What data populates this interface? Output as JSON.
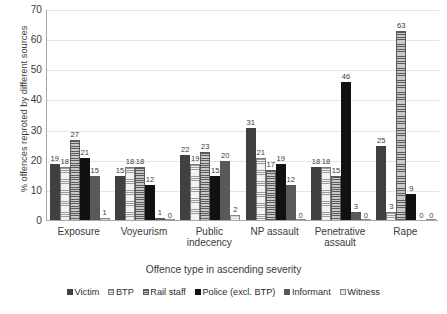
{
  "chart_data": {
    "type": "bar",
    "title": "",
    "xlabel": "Offence type in ascending severity",
    "ylabel": "% offences reproted by different sources",
    "ylim": [
      0,
      70
    ],
    "yticks": [
      0,
      10,
      20,
      30,
      40,
      50,
      60,
      70
    ],
    "grid": true,
    "legend_position": "bottom",
    "categories": [
      "Exposure",
      "Voyeurism",
      "Public indecency",
      "NP assault",
      "Penetrative assault",
      "Rape"
    ],
    "series": [
      {
        "name": "Victim",
        "values": [
          19,
          15,
          22,
          31,
          18,
          25
        ]
      },
      {
        "name": "BTP",
        "values": [
          18,
          18,
          19,
          21,
          18,
          3
        ]
      },
      {
        "name": "Rail staff",
        "values": [
          27,
          18,
          23,
          17,
          15,
          63
        ]
      },
      {
        "name": "Police (excl. BTP)",
        "values": [
          21,
          12,
          15,
          19,
          46,
          9
        ]
      },
      {
        "name": "Informant",
        "values": [
          15,
          1,
          20,
          12,
          3,
          0
        ]
      },
      {
        "name": "Witness",
        "values": [
          1,
          0,
          2,
          0,
          0,
          0
        ]
      }
    ]
  },
  "axis": {
    "y_title": "% offences reproted by different sources",
    "x_title": "Offence type in ascending severity",
    "y_ticks": [
      "0",
      "10",
      "20",
      "30",
      "40",
      "50",
      "60",
      "70"
    ],
    "x_categories": [
      "Exposure",
      "Voyeurism",
      "Public\nindecency",
      "NP assault",
      "Penetrative\nassault",
      "Rape"
    ]
  },
  "legend": {
    "items": [
      {
        "label": "Victim",
        "swatch": "series-swatch-victim"
      },
      {
        "label": "BTP",
        "swatch": "series-swatch-btp"
      },
      {
        "label": "Rail staff",
        "swatch": "series-swatch-rail-staff"
      },
      {
        "label": "Police (excl. BTP)",
        "swatch": "series-swatch-police"
      },
      {
        "label": "Informant",
        "swatch": "series-swatch-informant"
      },
      {
        "label": "Witness",
        "swatch": "series-swatch-witness"
      }
    ]
  },
  "colors": {
    "victim": "#404040",
    "btp": "#f2f2f2",
    "rail_staff": "#bdbdbd",
    "police": "#111111",
    "informant": "#595959",
    "witness": "#fbfbfb",
    "axis": "#a6a6a6",
    "grid": "#e4e4e4",
    "text": "#3a3a3a"
  }
}
